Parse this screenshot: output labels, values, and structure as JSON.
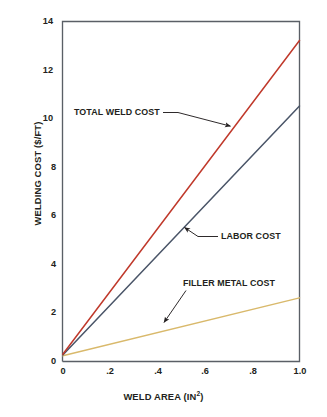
{
  "chart_data": {
    "type": "line",
    "title": "",
    "subtitle": "",
    "xlabel": "WELD AREA (IN",
    "xlabel_sup": "2",
    "xlabel_suffix": ")",
    "xlabel_full": "WELD AREA (IN2)",
    "ylabel": "WELDING COST ($/FT)",
    "xlim": [
      0,
      1.0
    ],
    "ylim": [
      0,
      14
    ],
    "xticks": [
      "0",
      ".2",
      ".4",
      ".6",
      ".8",
      "1.0"
    ],
    "xtick_values": [
      0,
      0.2,
      0.4,
      0.6,
      0.8,
      1.0
    ],
    "yticks": [
      "0",
      "2",
      "4",
      "6",
      "8",
      "10",
      "12",
      "14"
    ],
    "ytick_values": [
      0,
      2,
      4,
      6,
      8,
      10,
      12,
      14
    ],
    "grid": false,
    "legend": "none (inline annotations with leader lines)",
    "series": [
      {
        "name": "TOTAL WELD COST",
        "color": "#c0392b",
        "x": [
          0,
          1.0
        ],
        "values": [
          0.28,
          13.2
        ]
      },
      {
        "name": "LABOR COST",
        "color": "#4a5568",
        "x": [
          0,
          1.0
        ],
        "values": [
          0.25,
          10.5
        ]
      },
      {
        "name": "FILLER METAL COST",
        "color": "#d9b96b",
        "x": [
          0,
          1.0
        ],
        "values": [
          0.22,
          2.6
        ]
      }
    ],
    "annotations": [
      {
        "text": "TOTAL WELD COST",
        "points_at_series": "TOTAL WELD COST",
        "point_x": 0.73,
        "point_y": 9.7
      },
      {
        "text": "LABOR COST",
        "points_at_series": "LABOR COST",
        "point_x": 0.5,
        "point_y": 5.5
      },
      {
        "text": "FILLER METAL COST",
        "points_at_series": "FILLER METAL COST",
        "point_x": 0.4,
        "point_y": 1.15
      }
    ]
  },
  "figure": {
    "background_color": "#ffffff",
    "frame_color": "#5a5f66",
    "text_color": "#231f20"
  }
}
